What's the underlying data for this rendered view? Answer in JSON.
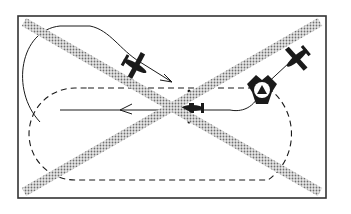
{
  "figure": {
    "colors": {
      "background": "#ffffff",
      "ink": "#1a1a1a",
      "cross_stripe": "#9a9a9a",
      "frame": "#333333"
    },
    "frame": {
      "x": 18,
      "y": 16,
      "width": 308,
      "height": 182
    },
    "elements": [
      {
        "id": "cross-out",
        "type": "X",
        "meaning": "incorrect procedure"
      },
      {
        "id": "racetrack-pattern",
        "type": "dashed oval"
      },
      {
        "id": "entry-path",
        "type": "solid curve with arrows"
      },
      {
        "id": "aircraft-1",
        "position": "upper-left",
        "heading": "down-right"
      },
      {
        "id": "aircraft-2",
        "position": "upper-right",
        "heading": "down-left"
      },
      {
        "id": "aircraft-3",
        "position": "center",
        "heading": "left"
      },
      {
        "id": "beacon",
        "type": "tri-lobed navaid symbol with triangle",
        "position": "right"
      }
    ],
    "icons": [
      "airplane-icon",
      "beacon-icon",
      "arrow-icon",
      "cross-icon"
    ]
  }
}
